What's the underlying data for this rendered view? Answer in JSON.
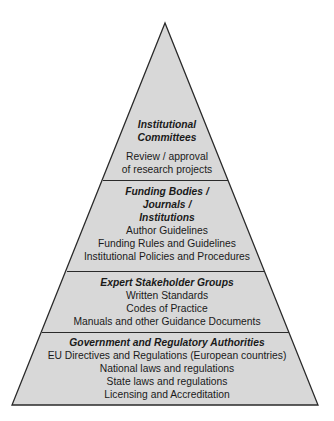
{
  "diagram": {
    "type": "pyramid",
    "colors": {
      "fill": "#d8d8d8",
      "stroke": "#2a2a2a",
      "text": "#1a1a1a"
    },
    "tiers": [
      {
        "heading_lines": [
          "Institutional",
          "Committees"
        ],
        "items": [
          "Review / approval",
          "of research projects"
        ]
      },
      {
        "heading_lines": [
          "Funding Bodies /",
          "Journals /",
          "Institutions"
        ],
        "items": [
          "Author Guidelines",
          "Funding Rules and Guidelines",
          "Institutional Policies and Procedures"
        ]
      },
      {
        "heading_lines": [
          "Expert Stakeholder Groups"
        ],
        "items": [
          "Written Standards",
          "Codes of Practice",
          "Manuals and other Guidance Documents"
        ]
      },
      {
        "heading_lines": [
          "Government and Regulatory Authorities"
        ],
        "items": [
          "EU Directives and Regulations (European countries)",
          "National laws and regulations",
          "State laws and regulations",
          "Licensing and Accreditation"
        ]
      }
    ]
  }
}
